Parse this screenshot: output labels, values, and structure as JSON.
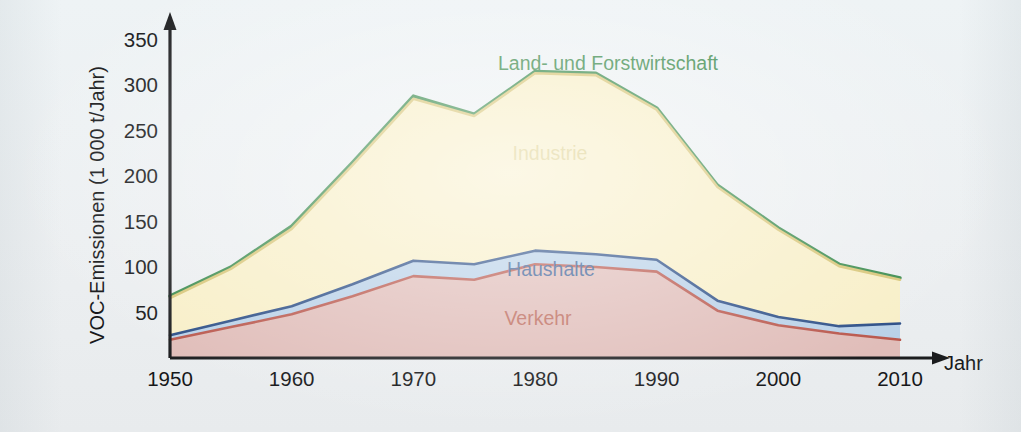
{
  "chart_data": {
    "type": "area",
    "stacked": true,
    "title": "",
    "xlabel": "Jahr",
    "ylabel": "VOC-Emissionen (1 000 t/Jahr)",
    "xlim": [
      1950,
      2010
    ],
    "ylim": [
      0,
      365
    ],
    "xticks": [
      "1950",
      "1960",
      "1970",
      "1980",
      "1990",
      "2000",
      "2010"
    ],
    "xtick_values": [
      1950,
      1960,
      1970,
      1980,
      1990,
      2000,
      2010
    ],
    "yticks": [
      "50",
      "100",
      "150",
      "200",
      "250",
      "300",
      "350"
    ],
    "ytick_values": [
      50,
      100,
      150,
      200,
      250,
      300,
      350
    ],
    "grid": false,
    "legend_position": "inline-annotations",
    "x": [
      1950,
      1955,
      1960,
      1965,
      1970,
      1975,
      1980,
      1985,
      1990,
      1995,
      2000,
      2005,
      2010
    ],
    "series": [
      {
        "name": "Verkehr",
        "color": "#e0bdb9",
        "line_color": "#b9574c",
        "label_color": "#bd6b5d",
        "values": [
          20,
          34,
          48,
          68,
          90,
          86,
          103,
          100,
          95,
          52,
          36,
          27,
          20
        ]
      },
      {
        "name": "Haushalte",
        "color": "#b9d1e8",
        "line_color": "#2d4f87",
        "label_color": "#3b5f96",
        "values": [
          5,
          7,
          9,
          13,
          17,
          17,
          15,
          14,
          13,
          11,
          9,
          8,
          18
        ]
      },
      {
        "name": "Industrie",
        "color": "#f8efc8",
        "line_color": "#d8c678",
        "label_color": "#ddcf8c",
        "values": [
          41,
          57,
          85,
          131,
          178,
          163,
          195,
          197,
          165,
          125,
          96,
          66,
          48
        ]
      },
      {
        "name": "Land- und Forstwirtschaft",
        "color": "#ffffff",
        "line_color": "#3c8c4f",
        "label_color": "#3f8c4e",
        "values": [
          2,
          2,
          3,
          3,
          3,
          2,
          2,
          2,
          2,
          2,
          2,
          2,
          2
        ]
      }
    ],
    "cumulative_totals": [
      68,
      100,
      145,
      215,
      288,
      268,
      315,
      313,
      275,
      190,
      143,
      103,
      88
    ],
    "annotations": [
      {
        "text": "Land- und Forstwirtschaft",
        "series": "Land- und Forstwirtschaft",
        "x": 608,
        "y": 70
      },
      {
        "text": "Industrie",
        "series": "Industrie",
        "x": 550,
        "y": 160
      },
      {
        "text": "Haushalte",
        "series": "Haushalte",
        "x": 551,
        "y": 276
      },
      {
        "text": "Verkehr",
        "series": "Verkehr",
        "x": 538,
        "y": 325
      }
    ],
    "axis_arrow_labels": {
      "x_axis_end": "Jahr"
    },
    "colors": {
      "background": "#eef2f4",
      "axis": "#1b1c1e",
      "text": "#17181a"
    }
  }
}
